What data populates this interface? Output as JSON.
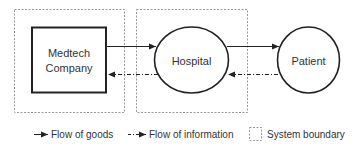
{
  "diagram": {
    "nodes": [
      {
        "id": "medtech",
        "label_line1": "Medtech",
        "label_line2": "Company",
        "shape": "rectangle"
      },
      {
        "id": "hospital",
        "label": "Hospital",
        "shape": "ellipse"
      },
      {
        "id": "patient",
        "label": "Patient",
        "shape": "circle"
      }
    ],
    "edges": [
      {
        "from": "medtech",
        "to": "hospital",
        "type": "Flow of goods"
      },
      {
        "from": "hospital",
        "to": "patient",
        "type": "Flow of goods"
      },
      {
        "from": "hospital",
        "to": "medtech",
        "type": "Flow of information"
      },
      {
        "from": "patient",
        "to": "hospital",
        "type": "Flow of information"
      }
    ],
    "system_boundaries": [
      "medtech",
      "hospital"
    ]
  },
  "legend": {
    "goods": "Flow of goods",
    "information": "Flow of information",
    "boundary": "System boundary"
  },
  "colors": {
    "line": "#222222",
    "boundary": "#999999",
    "text": "#333333"
  }
}
